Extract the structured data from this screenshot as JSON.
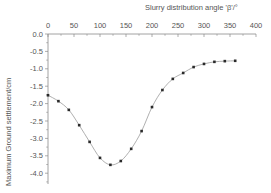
{
  "chart_data": {
    "type": "line",
    "title": "",
    "xlabel": "Slurry distribution angle 'β'/°",
    "ylabel": "Maximum Ground settlement/cm",
    "xlim": [
      0,
      400
    ],
    "ylim": [
      -4.3,
      0.0
    ],
    "x_ticks": [
      0,
      50,
      100,
      150,
      200,
      250,
      300,
      350,
      400
    ],
    "y_ticks": [
      0.0,
      -0.5,
      -1.0,
      -1.5,
      -2.0,
      -2.5,
      -3.0,
      -3.5,
      -4.0
    ],
    "x_tick_labels": [
      "0",
      "50",
      "100",
      "150",
      "200",
      "250",
      "300",
      "350",
      "400"
    ],
    "y_tick_labels": [
      "0.0",
      "-0.5",
      "-1.0",
      "-1.5",
      "-2.0",
      "-2.5",
      "-3.0",
      "-3.5",
      "-4.0"
    ],
    "x_axis_position": "top",
    "grid": false,
    "legend": null,
    "series": [
      {
        "name": "Maximum ground settlement",
        "marker": "square",
        "line_style": "smooth",
        "x": [
          0,
          20,
          40,
          60,
          80,
          100,
          120,
          140,
          160,
          180,
          200,
          220,
          240,
          260,
          280,
          300,
          320,
          340,
          360
        ],
        "y": [
          -1.76,
          -1.93,
          -2.18,
          -2.62,
          -3.1,
          -3.56,
          -3.76,
          -3.65,
          -3.3,
          -2.79,
          -2.1,
          -1.61,
          -1.29,
          -1.12,
          -0.95,
          -0.86,
          -0.8,
          -0.78,
          -0.77
        ]
      }
    ]
  },
  "colors": {
    "axis": "#8a8a8a",
    "line": "#9a9a9a",
    "marker": "#2a2a2a",
    "text": "#555555"
  }
}
